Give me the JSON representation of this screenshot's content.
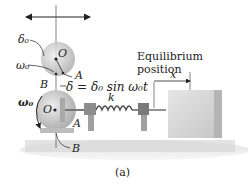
{
  "figure": {
    "caption": "(a)",
    "labels": {
      "delta0": "δ₀",
      "omega0_top": "ω₀",
      "O_top": "O",
      "A_top": "A",
      "B_top": "B",
      "displacement_eq": "δ = δ₀ sin ω₀t",
      "k": "k",
      "omega0_bottom": "ω₀",
      "O_bottom": "O",
      "A_bottom": "A",
      "B_bottom": "B",
      "equilibrium_line1": "Equilibrium",
      "equilibrium_line2": "position",
      "x": "x"
    },
    "colors": {
      "disk": "#c9c9c9",
      "block_front": "#d8d8d8",
      "block_side": "#b5b5b5",
      "ground": "#cfcfcf",
      "line": "#222222"
    }
  }
}
